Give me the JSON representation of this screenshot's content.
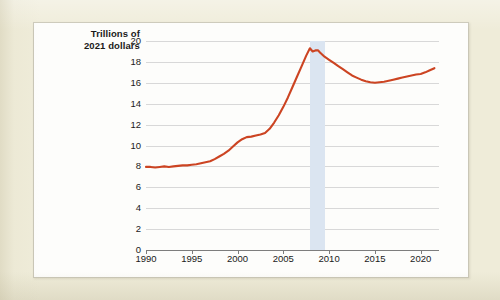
{
  "chart_data": {
    "type": "line",
    "title": "",
    "subtitle": "",
    "xlabel": "",
    "ylabel": "Trillions of 2021 dollars",
    "ylabel_lines": [
      "Trillions of",
      "2021 dollars"
    ],
    "xlim": [
      1990,
      2022
    ],
    "ylim": [
      0,
      20
    ],
    "grid": true,
    "legend": null,
    "yticks": [
      0,
      2,
      4,
      6,
      8,
      10,
      12,
      14,
      16,
      18,
      20
    ],
    "ytick_labels": [
      "0",
      "2",
      "4",
      "6",
      "8",
      "10",
      "12",
      "14",
      "16",
      "18",
      "20"
    ],
    "xticks": [
      1990,
      1995,
      2000,
      2005,
      2010,
      2015,
      2020
    ],
    "xtick_labels": [
      "1990",
      "1995",
      "2000",
      "2005",
      "2010",
      "2015",
      "2020"
    ],
    "line_color": "#cc4422",
    "band_color": "#dbe5f1",
    "grid_color": "#d8d8d8",
    "axis_color": "#7d7d7d",
    "shaded_regions": [
      {
        "name": "recession",
        "x_start": 2007.9,
        "x_end": 2009.5
      }
    ],
    "series": [
      {
        "name": "value",
        "color": "#cc4422",
        "x": [
          1990,
          1990.5,
          1991,
          1991.5,
          1992,
          1992.5,
          1993,
          1993.5,
          1994,
          1994.5,
          1995,
          1995.5,
          1996,
          1996.5,
          1997,
          1997.5,
          1998,
          1998.5,
          1999,
          1999.5,
          2000,
          2000.5,
          2001,
          2001.5,
          2002,
          2002.5,
          2003,
          2003.5,
          2004,
          2004.5,
          2005,
          2005.5,
          2006,
          2006.5,
          2007,
          2007.5,
          2007.9,
          2008.2,
          2008.5,
          2008.8,
          2009,
          2009.5,
          2010,
          2010.5,
          2011,
          2011.5,
          2012,
          2012.5,
          2013,
          2013.5,
          2014,
          2014.5,
          2015,
          2015.5,
          2016,
          2016.5,
          2017,
          2017.5,
          2018,
          2018.5,
          2019,
          2019.5,
          2020,
          2020.5,
          2021,
          2021.5
        ],
        "y": [
          7.95,
          7.95,
          7.9,
          7.95,
          8.0,
          7.95,
          8.0,
          8.05,
          8.1,
          8.1,
          8.15,
          8.2,
          8.3,
          8.4,
          8.5,
          8.7,
          8.95,
          9.2,
          9.5,
          9.9,
          10.3,
          10.6,
          10.8,
          10.85,
          10.95,
          11.05,
          11.2,
          11.6,
          12.2,
          12.9,
          13.7,
          14.6,
          15.6,
          16.6,
          17.6,
          18.6,
          19.3,
          19.0,
          19.1,
          19.1,
          18.9,
          18.5,
          18.2,
          17.9,
          17.6,
          17.3,
          17.0,
          16.7,
          16.5,
          16.3,
          16.15,
          16.05,
          16.0,
          16.05,
          16.1,
          16.2,
          16.3,
          16.4,
          16.5,
          16.6,
          16.7,
          16.8,
          16.85,
          17.0,
          17.2,
          17.4
        ]
      }
    ]
  }
}
